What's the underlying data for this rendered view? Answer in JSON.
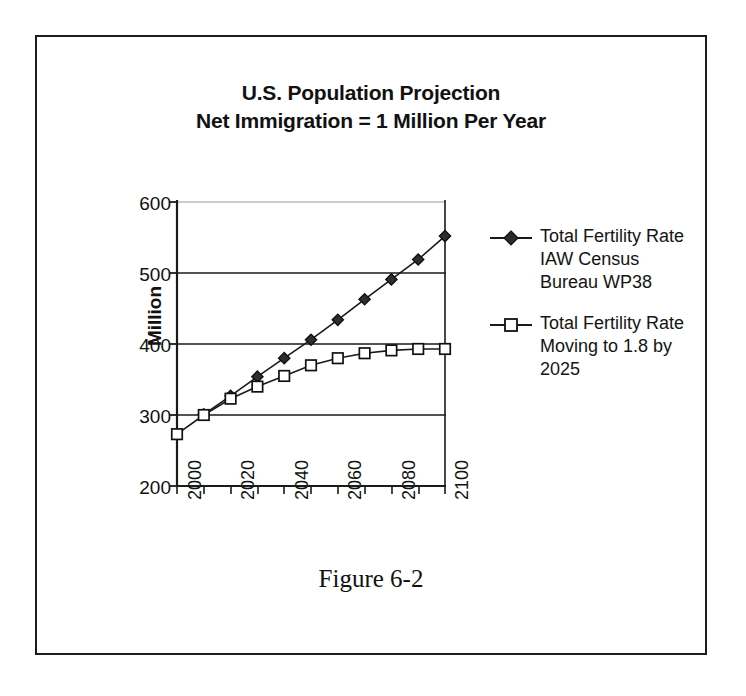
{
  "figure": {
    "caption": "Figure 6-2",
    "frame_color": "#1c1c1c",
    "background": "#ffffff"
  },
  "chart_data": {
    "type": "line",
    "title": "U.S. Population Projection",
    "subtitle": "Net Immigration = 1 Million Per Year",
    "xlabel": "",
    "ylabel": "Million",
    "xlim": [
      2000,
      2100
    ],
    "ylim": [
      200,
      600
    ],
    "yticks": [
      200,
      300,
      400,
      500,
      600
    ],
    "xticks": [
      2000,
      2010,
      2020,
      2030,
      2040,
      2050,
      2060,
      2070,
      2080,
      2090,
      2100
    ],
    "xtick_labels": [
      "2000",
      "",
      "2020",
      "",
      "2040",
      "",
      "2060",
      "",
      "2080",
      "",
      "2100"
    ],
    "xtick_labels_shown": [
      "2000",
      "2020",
      "2040",
      "2060",
      "2080",
      "2100"
    ],
    "grid": "horizontal",
    "legend_position": "right",
    "series": [
      {
        "name": "Total Fertility Rate IAW Census Bureau WP38",
        "marker": "filled-diamond",
        "color": "#1a1a1a",
        "x": [
          2010,
          2020,
          2030,
          2040,
          2050,
          2060,
          2070,
          2080,
          2090,
          2100
        ],
        "values": [
          301,
          327,
          354,
          380,
          406,
          434,
          463,
          491,
          519,
          552
        ]
      },
      {
        "name": "Total Fertility Rate Moving to 1.8 by 2025",
        "marker": "open-square",
        "color": "#1a1a1a",
        "x": [
          2000,
          2010,
          2020,
          2030,
          2040,
          2050,
          2060,
          2070,
          2080,
          2090,
          2100
        ],
        "values": [
          273,
          300,
          323,
          340,
          355,
          370,
          380,
          387,
          391,
          393,
          393
        ]
      }
    ]
  },
  "legend": {
    "entries": [
      {
        "label": "Total Fertility Rate IAW Census Bureau WP38",
        "marker": "filled-diamond"
      },
      {
        "label": "Total Fertility Rate Moving to 1.8 by 2025",
        "marker": "open-square"
      }
    ]
  }
}
